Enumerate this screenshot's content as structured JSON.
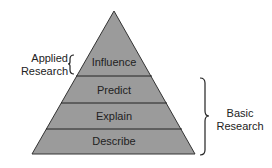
{
  "diagram": {
    "fill_color": "#9b9b9b",
    "line_color": "#222222",
    "levels": [
      {
        "label": "Influence"
      },
      {
        "label": "Predict"
      },
      {
        "label": "Explain"
      },
      {
        "label": "Describe"
      }
    ],
    "brackets": {
      "applied": {
        "line1": "Applied",
        "line2": "Research"
      },
      "basic": {
        "line1": "Basic",
        "line2": "Research"
      }
    }
  }
}
